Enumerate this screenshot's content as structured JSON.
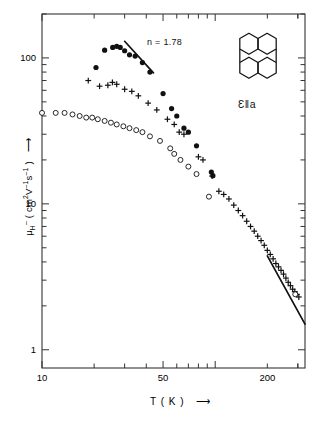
{
  "chart_data": {
    "type": "scatter",
    "title": "",
    "subtitle": "",
    "xlabel": "T ( K )",
    "ylabel_plain": "μH⁻ ( cm² V⁻¹ s⁻¹ )",
    "xscale": "log",
    "yscale": "log",
    "xlim": [
      10,
      330
    ],
    "ylim": [
      0.75,
      200
    ],
    "grid": false,
    "legend": "none",
    "xticklabels": [
      "10",
      "50",
      "200"
    ],
    "xticks": [
      10,
      50,
      200
    ],
    "yticklabels": [
      "100",
      "10",
      "1"
    ],
    "yticks": [
      100,
      10,
      1
    ],
    "annotations": [
      {
        "name": "exponent-label",
        "text": "n = 1.78",
        "x": 46,
        "y": 78
      },
      {
        "name": "orientation-label",
        "text": "Ɛ‖a",
        "x": 250,
        "y": 55
      },
      {
        "name": "molecule-inset",
        "text": "perylene",
        "x": 250,
        "y": 110
      }
    ],
    "series": [
      {
        "name": "filled-circles",
        "marker": "filled-circle",
        "points": [
          [
            20.5,
            86
          ],
          [
            23.0,
            113
          ],
          [
            25.6,
            118
          ],
          [
            27.0,
            120
          ],
          [
            28.3,
            118
          ],
          [
            30.0,
            112
          ],
          [
            32.0,
            105
          ],
          [
            34.5,
            103
          ],
          [
            38.0,
            93
          ],
          [
            42.0,
            80
          ],
          [
            50.0,
            57
          ],
          [
            56.0,
            45
          ],
          [
            60.0,
            40
          ],
          [
            66.0,
            33
          ],
          [
            70.0,
            31
          ],
          [
            78.0,
            25
          ],
          [
            95.0,
            16.5
          ],
          [
            97.0,
            15.6
          ]
        ]
      },
      {
        "name": "plus-markers",
        "marker": "plus",
        "points": [
          [
            18.5,
            70
          ],
          [
            21.5,
            64
          ],
          [
            24.0,
            65
          ],
          [
            25.5,
            68
          ],
          [
            27.0,
            66
          ],
          [
            30.0,
            61
          ],
          [
            33.0,
            59
          ],
          [
            36.0,
            55
          ],
          [
            41.0,
            49
          ],
          [
            46.0,
            44
          ],
          [
            53.0,
            38
          ],
          [
            58.0,
            35
          ],
          [
            62.0,
            31
          ],
          [
            66.0,
            30
          ],
          [
            80.0,
            21
          ],
          [
            85.0,
            20
          ],
          [
            96.0,
            15.5
          ],
          [
            105.0,
            12.2
          ],
          [
            112.0,
            11.6
          ],
          [
            120.0,
            10.8
          ],
          [
            128.0,
            9.8
          ],
          [
            136.0,
            9.0
          ],
          [
            144.0,
            8.3
          ],
          [
            152.0,
            7.6
          ],
          [
            160.0,
            7.0
          ],
          [
            168.0,
            6.5
          ],
          [
            176.0,
            6.0
          ],
          [
            184.0,
            5.6
          ],
          [
            192.0,
            5.2
          ],
          [
            200.0,
            4.8
          ],
          [
            208.0,
            4.5
          ],
          [
            216.0,
            4.2
          ],
          [
            224.0,
            3.9
          ],
          [
            232.0,
            3.7
          ],
          [
            240.0,
            3.5
          ],
          [
            248.0,
            3.3
          ],
          [
            256.0,
            3.1
          ],
          [
            264.0,
            2.9
          ],
          [
            272.0,
            2.75
          ],
          [
            280.0,
            2.6
          ],
          [
            288.0,
            2.5
          ],
          [
            296.0,
            2.4
          ],
          [
            304.0,
            2.3
          ]
        ]
      },
      {
        "name": "open-circles",
        "marker": "open-circle",
        "points": [
          [
            10.0,
            42
          ],
          [
            12.0,
            42
          ],
          [
            13.5,
            42
          ],
          [
            15.0,
            41
          ],
          [
            16.5,
            40
          ],
          [
            18.0,
            39
          ],
          [
            19.5,
            39
          ],
          [
            21.0,
            38
          ],
          [
            23.0,
            37
          ],
          [
            25.0,
            36
          ],
          [
            27.0,
            35
          ],
          [
            29.5,
            34
          ],
          [
            32.0,
            33
          ],
          [
            35.0,
            32
          ],
          [
            38.0,
            31
          ],
          [
            42.0,
            29
          ],
          [
            48.0,
            27
          ],
          [
            55.0,
            24
          ],
          [
            58.0,
            22
          ],
          [
            63.0,
            20
          ],
          [
            70.0,
            18
          ],
          [
            78.0,
            16
          ],
          [
            92.0,
            11.2
          ],
          [
            290.0,
            2.4
          ]
        ]
      }
    ],
    "fit_lines": [
      {
        "name": "low-temperature-fit",
        "exponent": 1.78,
        "x": [
          30,
          44
        ],
        "y": [
          130,
          79
        ]
      },
      {
        "name": "high-temperature-fit",
        "exponent": 1.78,
        "x": [
          200,
          330
        ],
        "y": [
          4.4,
          1.5
        ]
      }
    ]
  },
  "axis": {
    "ylabel_parts": {
      "mu": "μ",
      "sub": "H",
      "sup_minus": "–",
      "open": "( cm",
      "sup2": "2",
      "v": "V",
      "supm1a": "–1",
      "s": "s",
      "supm1b": "–1",
      "close": ")"
    },
    "y_arrow": "⟶",
    "x_arrow": "⟶"
  },
  "ticks": {
    "y": [
      {
        "label": "100",
        "value": 100
      },
      {
        "label": "10",
        "value": 10
      },
      {
        "label": "1",
        "value": 1
      }
    ],
    "x": [
      {
        "label": "10",
        "value": 10
      },
      {
        "label": "50",
        "value": 50
      },
      {
        "label": "200",
        "value": 200
      }
    ]
  },
  "colors": {
    "ink": "#111111",
    "background": "#ffffff",
    "frame": "#333333"
  }
}
